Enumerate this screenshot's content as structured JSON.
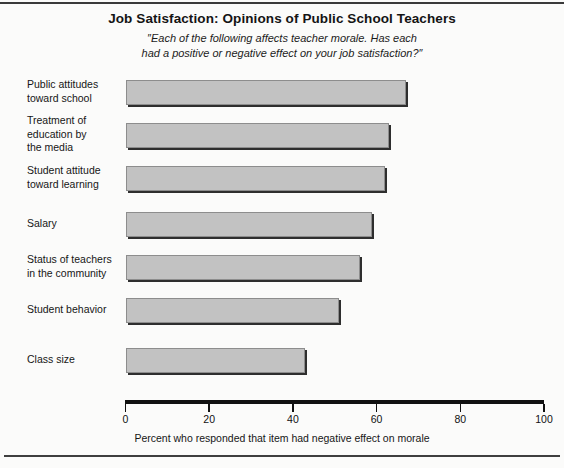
{
  "chart_data": {
    "type": "bar",
    "orientation": "horizontal",
    "title": "Job Satisfaction: Opinions of Public School Teachers",
    "subtitle_line1": "″Each of the following affects teacher morale. Has each",
    "subtitle_line2": "had a positive or negative effect on your job satisfaction?″",
    "xlabel": "Percent who responded that item had negative effect on morale",
    "ylabel": "",
    "xlim": [
      0,
      100
    ],
    "xticks": [
      0,
      20,
      40,
      60,
      80,
      100
    ],
    "xtick_labels": [
      "0",
      "20",
      "40",
      "60",
      "80",
      "100"
    ],
    "grid": false,
    "legend": "none",
    "bar_fill_color": "#c2c2c2",
    "bar_edge_color": "#8d8d8d",
    "bar_shadow_color": "#2e2e2e",
    "categories": [
      "Public attitudes toward school",
      "Treatment of education by the media",
      "Student attitude toward learning",
      "Salary",
      "Status of teachers in the community",
      "Student behavior",
      "Class size"
    ],
    "category_label_lines": [
      [
        "Public attitudes",
        "toward school"
      ],
      [
        "Treatment of",
        "education by",
        "the media"
      ],
      [
        "Student attitude",
        "toward learning"
      ],
      [
        "Salary"
      ],
      [
        "Status of teachers",
        "in the community"
      ],
      [
        "Student behavior"
      ],
      [
        "Class size"
      ]
    ],
    "values": [
      67,
      63,
      62,
      59,
      56,
      51,
      43
    ]
  }
}
